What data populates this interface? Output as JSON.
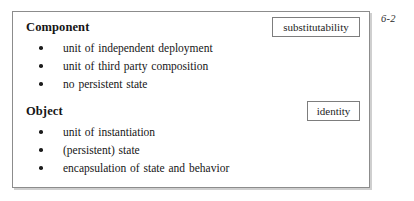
{
  "page_marker": "6-2",
  "slide": {
    "sections": [
      {
        "id": "component",
        "heading": "Component",
        "tag": "substitutability",
        "bullets": [
          "unit of independent deployment",
          "unit of third party composition",
          "no persistent state"
        ]
      },
      {
        "id": "object",
        "heading": "Object",
        "tag": "identity",
        "bullets": [
          "unit of instantiation",
          "(persistent) state",
          "encapsulation of state and behavior"
        ]
      }
    ]
  },
  "colors": {
    "page_background": "#ffffff",
    "frame_border": "#8c8c8c",
    "frame_shadow": "#cfcfcf",
    "tag_border": "#7d7d7d",
    "text": "#161616",
    "bullet_marker": "#1d1d1d"
  }
}
